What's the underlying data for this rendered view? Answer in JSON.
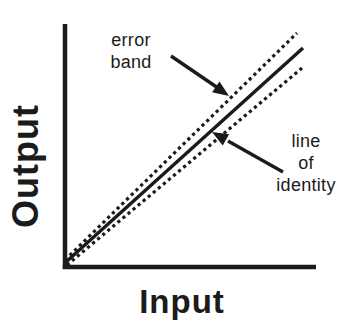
{
  "figure": {
    "type": "schematic-line-plot",
    "background_color": "#ffffff",
    "ink_color": "#1b1b1b"
  },
  "axes": {
    "x_label": "Input",
    "y_label": "Output",
    "ticks": "none",
    "tick_values": []
  },
  "lines": [
    {
      "id": "upper-error",
      "style": "dotted",
      "meaning": "upper edge of error band"
    },
    {
      "id": "identity",
      "style": "solid",
      "meaning": "line of identity"
    },
    {
      "id": "lower-error",
      "style": "dotted",
      "meaning": "lower edge of error band"
    }
  ],
  "annotations": {
    "error_band": {
      "text": "error band",
      "lines": [
        "error",
        "band"
      ],
      "arrow_points_to": "upper dotted error-band line"
    },
    "line_of_identity": {
      "text": "line of identity",
      "lines": [
        "line",
        "of",
        "identity"
      ],
      "arrow_points_to": "solid identity line"
    }
  }
}
